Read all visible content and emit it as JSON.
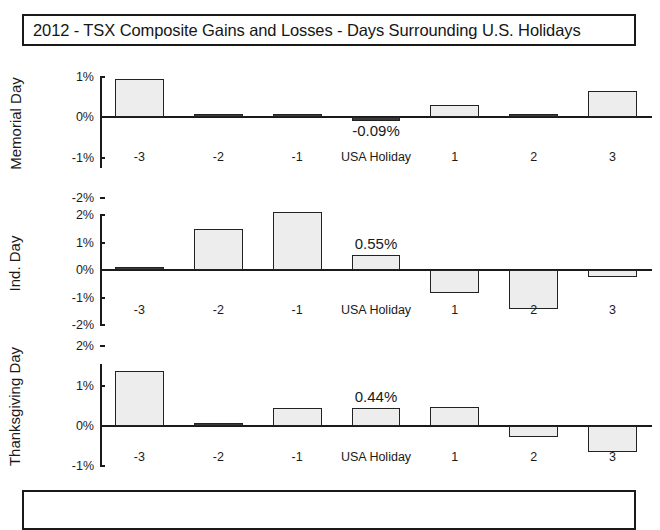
{
  "title": "2012 - TSX Composite Gains and Losses - Days Surrounding U.S. Holidays",
  "x_categories": [
    "-3",
    "-2",
    "-1",
    "USA Holiday",
    "1",
    "2",
    "3"
  ],
  "panels": [
    {
      "name": "Memorial Day",
      "ylabels": [
        "1%",
        "0%",
        "-1%",
        "-2%"
      ],
      "annotation": "-0.09%",
      "annotation_index": 3
    },
    {
      "name": "Ind. Day",
      "ylabels": [
        "2%",
        "1%",
        "0%",
        "-1%",
        "-2%"
      ],
      "annotation": "0.55%",
      "annotation_index": 3
    },
    {
      "name": "Thanksgiving Day",
      "ylabels": [
        "2%",
        "1%",
        "0%",
        "-1%"
      ],
      "annotation": "0.44%",
      "annotation_index": 3
    }
  ],
  "chart_data": [
    {
      "type": "bar",
      "title": "Memorial Day",
      "xlabel": "",
      "ylabel": "Memorial Day",
      "categories": [
        "-3",
        "-2",
        "-1",
        "USA Holiday",
        "1",
        "2",
        "3"
      ],
      "values": [
        0.95,
        0.0,
        0.07,
        -0.09,
        0.3,
        0.0,
        0.63
      ],
      "ylim": [
        -2,
        1
      ],
      "yticks": [
        1,
        0,
        -1,
        -2
      ],
      "ytick_labels": [
        "1%",
        "0%",
        "-1%",
        "-2%"
      ],
      "grid": false,
      "legend": false,
      "annotations": [
        {
          "category": "USA Holiday",
          "text": "-0.09%"
        }
      ]
    },
    {
      "type": "bar",
      "title": "Ind. Day",
      "xlabel": "",
      "ylabel": "Ind. Day",
      "categories": [
        "-3",
        "-2",
        "-1",
        "USA Holiday",
        "1",
        "2",
        "3"
      ],
      "values": [
        0.07,
        1.5,
        2.1,
        0.55,
        -0.85,
        -1.4,
        -0.25
      ],
      "ylim": [
        -2,
        2
      ],
      "yticks": [
        2,
        1,
        0,
        -1,
        -2
      ],
      "ytick_labels": [
        "2%",
        "1%",
        "0%",
        "-1%",
        "-2%"
      ],
      "grid": false,
      "legend": false,
      "annotations": [
        {
          "category": "USA Holiday",
          "text": "0.55%"
        }
      ]
    },
    {
      "type": "bar",
      "title": "Thanksgiving Day",
      "xlabel": "",
      "ylabel": "Thanksgiving Day",
      "categories": [
        "-3",
        "-2",
        "-1",
        "USA Holiday",
        "1",
        "2",
        "3"
      ],
      "values": [
        1.37,
        0.03,
        0.45,
        0.44,
        0.47,
        -0.27,
        -0.65
      ],
      "ylim": [
        -1,
        2
      ],
      "yticks": [
        2,
        1,
        0,
        -1
      ],
      "ytick_labels": [
        "2%",
        "1%",
        "0%",
        "-1%"
      ],
      "grid": false,
      "legend": false,
      "annotations": [
        {
          "category": "USA Holiday",
          "text": "0.44%"
        }
      ]
    }
  ],
  "colors": {
    "bar_fill": "#ededed",
    "bar_stroke": "#222222",
    "axis": "#1a1a1a",
    "background": "#ffffff"
  }
}
